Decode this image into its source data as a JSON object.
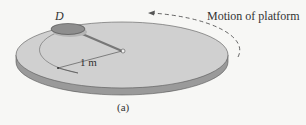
{
  "figure": {
    "disk_label": "D",
    "radius_label": "1 m",
    "motion_label": "Motion of platform",
    "caption": "(a)"
  },
  "colors": {
    "background": "#f7f7f5",
    "platform_top": "#cfcfcf",
    "platform_side": "#9a9a9a",
    "disk": "#8e8e8e",
    "text": "#333333"
  }
}
